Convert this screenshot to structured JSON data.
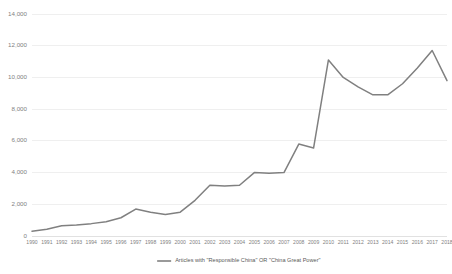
{
  "chart_data": {
    "type": "line",
    "title": "",
    "subtitle": "",
    "xlabel": "",
    "ylabel": "",
    "grid": true,
    "legend_position": "bottom-center",
    "ylim": [
      0,
      14000
    ],
    "yticks": [
      "0",
      "2,000",
      "4,000",
      "6,000",
      "8,000",
      "10,000",
      "12,000",
      "14,000"
    ],
    "ytick_values": [
      0,
      2000,
      4000,
      6000,
      8000,
      10000,
      12000,
      14000
    ],
    "categories": [
      "1990",
      "1991",
      "1992",
      "1993",
      "1994",
      "1995",
      "1996",
      "1997",
      "1998",
      "1999",
      "2000",
      "2001",
      "2002",
      "2003",
      "2004",
      "2005",
      "2006",
      "2007",
      "2008",
      "2009",
      "2010",
      "2011",
      "2012",
      "2013",
      "2014",
      "2015",
      "2016",
      "2017",
      "2018"
    ],
    "series": [
      {
        "name": "Articles with \"Responsible China\" OR \"China Great Power\"",
        "color": "#808080",
        "values": [
          300,
          420,
          650,
          700,
          780,
          900,
          1150,
          1700,
          1500,
          1350,
          1500,
          2250,
          3200,
          3150,
          3200,
          4000,
          3950,
          4000,
          5800,
          5550,
          11100,
          10000,
          9400,
          8900,
          8900,
          9600,
          10600,
          11700,
          9800
        ]
      }
    ]
  },
  "legend": {
    "entries": [
      {
        "label": "Articles with \"Responsible China\" OR \"China Great Power\"",
        "color": "#808080"
      }
    ]
  },
  "colors": {
    "line": "#808080",
    "grid": "#e8e8e8",
    "tick_text": "#7f7f7f",
    "legend_text": "#595959",
    "background": "#ffffff"
  }
}
